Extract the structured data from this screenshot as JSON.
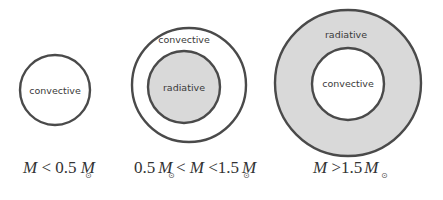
{
  "colors": {
    "outline": "#4a4a4a",
    "radiative_fill": "#d9d9d9",
    "convective_fill": "#ffffff",
    "text": "#3a3a3a"
  },
  "stars": [
    {
      "id": "low-mass",
      "zones": [
        {
          "label": "convective",
          "type": "convective",
          "role": "single"
        }
      ],
      "condition": {
        "text": "M < 0.5 M⊙",
        "parts": [
          "M",
          " < 0.5 ",
          "M",
          "⊙"
        ]
      }
    },
    {
      "id": "sun-like",
      "zones": [
        {
          "label": "convective",
          "type": "convective",
          "role": "outer"
        },
        {
          "label": "radiative",
          "type": "radiative",
          "role": "core"
        }
      ],
      "condition": {
        "text": "0.5 M⊙ < M < 1.5 M⊙",
        "parts": [
          "0.5",
          "M",
          "⊙",
          " < ",
          "M",
          " <1.5",
          "M",
          "⊙"
        ]
      }
    },
    {
      "id": "high-mass",
      "zones": [
        {
          "label": "radiative",
          "type": "radiative",
          "role": "outer"
        },
        {
          "label": "convective",
          "type": "convective",
          "role": "core"
        }
      ],
      "condition": {
        "text": "M > 1.5 M⊙",
        "parts": [
          "M",
          " >1.5",
          "M",
          "⊙"
        ]
      }
    }
  ]
}
